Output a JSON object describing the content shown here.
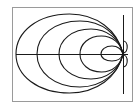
{
  "diagram": {
    "type": "nested-field-loops",
    "background": "#ffffff",
    "stroke_color": "#1a1a1a",
    "frame": {
      "x": 12,
      "y": 7,
      "width": 120,
      "height": 94,
      "color": "#9a9a9a"
    },
    "axes": {
      "horizontal": {
        "x1": 16,
        "y1": 54,
        "x2": 128,
        "y2": 54
      },
      "vertical": {
        "x1": 123,
        "y1": 15,
        "x2": 123,
        "y2": 94
      }
    },
    "origin": {
      "x": 123,
      "y": 54
    },
    "loops": [
      {
        "name": "loop-1",
        "left_x": 16,
        "top_y": 14,
        "bottom_y": 93
      },
      {
        "name": "loop-2",
        "left_x": 37,
        "top_y": 21,
        "bottom_y": 87
      },
      {
        "name": "loop-3",
        "left_x": 59,
        "top_y": 29,
        "bottom_y": 79
      },
      {
        "name": "loop-4",
        "left_x": 80,
        "top_y": 36,
        "bottom_y": 72
      },
      {
        "name": "loop-5",
        "left_x": 101,
        "top_y": 46,
        "bottom_y": 61
      }
    ],
    "right_lobes": [
      {
        "name": "upper-lobe",
        "cy": 47,
        "ry": 6,
        "rx": 4
      },
      {
        "name": "lower-lobe",
        "cy": 61,
        "ry": 6,
        "rx": 4
      }
    ]
  }
}
